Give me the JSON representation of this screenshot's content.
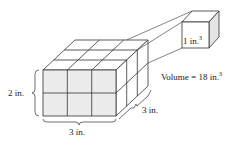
{
  "diagram": {
    "large_prism": {
      "width_label": "3 in.",
      "depth_label": "3 in.",
      "height_label": "2 in.",
      "cubes": {
        "width": 3,
        "depth": 3,
        "height": 2
      }
    },
    "unit_cube": {
      "label": "1 in.",
      "label_exp": "3"
    },
    "volume": {
      "label": "Volume = 18 in.",
      "label_exp": "3"
    },
    "colors": {
      "front_face": "#ececec",
      "side_face": "#ffffff",
      "top_face": "#ffffff",
      "unit_side": "#e4e4e4",
      "line": "#333333"
    }
  }
}
